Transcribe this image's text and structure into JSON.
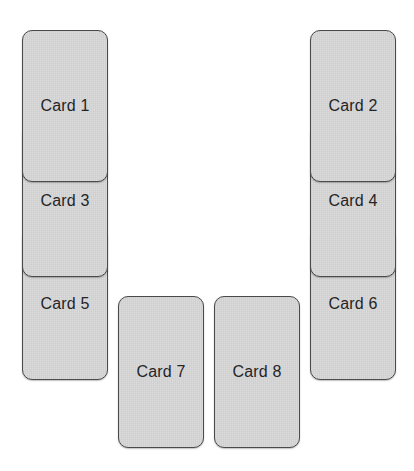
{
  "colors": {
    "background": "#ffffff",
    "card_fill": "#d6d6d6",
    "card_border": "#4a4a4a",
    "label_text": "#252525"
  },
  "cards": [
    {
      "label": "Card 1",
      "column": "left",
      "stack_index": 0
    },
    {
      "label": "Card 2",
      "column": "right",
      "stack_index": 0
    },
    {
      "label": "Card 3",
      "column": "left",
      "stack_index": 1
    },
    {
      "label": "Card 4",
      "column": "right",
      "stack_index": 1
    },
    {
      "label": "Card 5",
      "column": "left",
      "stack_index": 2
    },
    {
      "label": "Card 6",
      "column": "right",
      "stack_index": 2
    },
    {
      "label": "Card 7",
      "column": "bottom-center-left",
      "stack_index": 0
    },
    {
      "label": "Card 8",
      "column": "bottom-center-right",
      "stack_index": 0
    }
  ]
}
